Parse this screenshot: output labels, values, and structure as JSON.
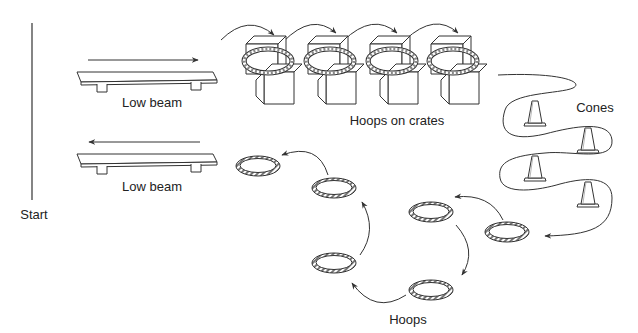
{
  "diagram": {
    "type": "obstacle-course",
    "labels": {
      "start": "Start",
      "beam_1": "Low beam",
      "beam_2": "Low beam",
      "crates": "Hoops on crates",
      "cones": "Cones",
      "hoops": "Hoops"
    },
    "stations": [
      {
        "name": "Start",
        "kind": "start-line"
      },
      {
        "name": "Low beam",
        "kind": "beam",
        "direction": "right"
      },
      {
        "name": "Hoops on crates",
        "kind": "hoops-on-crates",
        "count": 4
      },
      {
        "name": "Cones",
        "kind": "cones",
        "count": 4
      },
      {
        "name": "Hoops",
        "kind": "floor-hoops",
        "count": 6
      },
      {
        "name": "Low beam",
        "kind": "beam",
        "direction": "left"
      }
    ],
    "colors": {
      "stroke": "#333333",
      "background": "#ffffff",
      "text": "#222222"
    }
  }
}
